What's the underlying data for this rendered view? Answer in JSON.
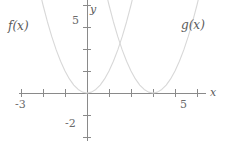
{
  "chart_data": {
    "type": "line",
    "title": "",
    "xlabel": "x",
    "ylabel": "y",
    "grid": false,
    "legend_position": "inline-curve-labels",
    "xlim": [
      -3.1,
      5.4
    ],
    "ylim": [
      -2.2,
      5.4
    ],
    "xticks": [
      -3,
      -2,
      -1,
      0,
      1,
      2,
      3,
      4,
      5
    ],
    "yticks": [
      -2,
      -1,
      0,
      1,
      2,
      3,
      4,
      5
    ],
    "xtick_labels": {
      "-3": "-3",
      "5": "5"
    },
    "ytick_labels": {
      "5": "5",
      "-2": "-2"
    },
    "axis_label_x": "x",
    "axis_label_y": "y",
    "series": [
      {
        "name": "f(x)",
        "label": "f(x)",
        "equation": "y = x^2",
        "vertex": [
          0,
          0
        ],
        "color": "#d8d8d8",
        "points": [
          [
            -2.35,
            5.5
          ],
          [
            -2.2,
            4.84
          ],
          [
            -2.0,
            4.0
          ],
          [
            -1.8,
            3.24
          ],
          [
            -1.6,
            2.56
          ],
          [
            -1.4,
            1.96
          ],
          [
            -1.2,
            1.44
          ],
          [
            -1.0,
            1.0
          ],
          [
            -0.8,
            0.64
          ],
          [
            -0.6,
            0.36
          ],
          [
            -0.4,
            0.16
          ],
          [
            -0.2,
            0.04
          ],
          [
            0,
            0
          ],
          [
            0.2,
            0.04
          ],
          [
            0.4,
            0.16
          ],
          [
            0.6,
            0.36
          ],
          [
            0.8,
            0.64
          ],
          [
            1.0,
            1.0
          ],
          [
            1.2,
            1.44
          ],
          [
            1.4,
            1.96
          ],
          [
            1.6,
            2.56
          ],
          [
            1.8,
            3.24
          ],
          [
            2.0,
            4.0
          ],
          [
            2.2,
            4.84
          ],
          [
            2.35,
            5.5
          ]
        ]
      },
      {
        "name": "g(x)",
        "label": "g(x)",
        "equation": "y = (x - 3)^2",
        "vertex": [
          3,
          0
        ],
        "color": "#d8d8d8",
        "points": [
          [
            0.65,
            5.5
          ],
          [
            0.8,
            4.84
          ],
          [
            1.0,
            4.0
          ],
          [
            1.2,
            3.24
          ],
          [
            1.4,
            2.56
          ],
          [
            1.6,
            1.96
          ],
          [
            1.8,
            1.44
          ],
          [
            2.0,
            1.0
          ],
          [
            2.2,
            0.64
          ],
          [
            2.4,
            0.36
          ],
          [
            2.6,
            0.16
          ],
          [
            2.8,
            0.04
          ],
          [
            3.0,
            0
          ],
          [
            3.2,
            0.04
          ],
          [
            3.4,
            0.16
          ],
          [
            3.6,
            0.36
          ],
          [
            3.8,
            0.64
          ],
          [
            4.0,
            1.0
          ],
          [
            4.2,
            1.44
          ],
          [
            4.4,
            1.96
          ],
          [
            4.6,
            2.56
          ],
          [
            4.8,
            3.24
          ],
          [
            5.0,
            4.0
          ],
          [
            5.2,
            4.84
          ],
          [
            5.35,
            5.5
          ]
        ]
      }
    ],
    "axis_color": "#8a8a8a",
    "curve_color": "#d8d8d8",
    "background": "#ffffff"
  }
}
